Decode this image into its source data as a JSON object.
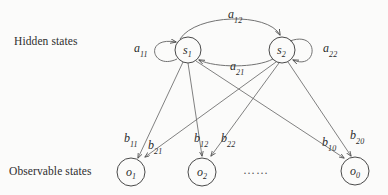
{
  "figure": {
    "type": "hidden-markov-model-diagram",
    "row_labels": {
      "hidden": "Hidden states",
      "observable": "Observable states"
    },
    "ellipsis": "……",
    "stroke_color": "#4a4a4a",
    "text_color": "#2b2b2b",
    "background_color": "#fbfbfa"
  },
  "hidden_states": [
    {
      "id": "s1",
      "base": "s",
      "sub": "1",
      "cx": 188,
      "cy": 50,
      "r": 13
    },
    {
      "id": "s2",
      "base": "s",
      "sub": "2",
      "cx": 282,
      "cy": 50,
      "r": 13
    }
  ],
  "observable_states": [
    {
      "id": "o1",
      "base": "o",
      "sub": "1",
      "cx": 131,
      "cy": 172,
      "r": 14
    },
    {
      "id": "o2",
      "base": "o",
      "sub": "2",
      "cx": 202,
      "cy": 172,
      "r": 14
    },
    {
      "id": "o0",
      "base": "o",
      "sub": "0",
      "cx": 355,
      "cy": 171,
      "r": 14
    }
  ],
  "transition_labels": [
    {
      "id": "a11",
      "base": "a",
      "sub": "11",
      "from": "s1",
      "to": "s1",
      "x": 134,
      "y": 42
    },
    {
      "id": "a12",
      "base": "a",
      "sub": "12",
      "from": "s1",
      "to": "s2",
      "x": 228,
      "y": 8
    },
    {
      "id": "a21",
      "base": "a",
      "sub": "21",
      "from": "s2",
      "to": "s1",
      "x": 230,
      "y": 60
    },
    {
      "id": "a22",
      "base": "a",
      "sub": "22",
      "from": "s2",
      "to": "s2",
      "x": 323,
      "y": 42
    }
  ],
  "emission_labels": [
    {
      "id": "b11",
      "base": "b",
      "sub": "11",
      "from": "s1",
      "to": "o1",
      "x": 124,
      "y": 132
    },
    {
      "id": "b21",
      "base": "b",
      "sub": "21",
      "from": "s2",
      "to": "o1",
      "x": 148,
      "y": 139
    },
    {
      "id": "b12",
      "base": "b",
      "sub": "12",
      "from": "s1",
      "to": "o2",
      "x": 194,
      "y": 132
    },
    {
      "id": "b22",
      "base": "b",
      "sub": "22",
      "from": "s2",
      "to": "o2",
      "x": 221,
      "y": 132
    },
    {
      "id": "b10",
      "base": "b",
      "sub": "10",
      "from": "s1",
      "to": "o0",
      "x": 322,
      "y": 136
    },
    {
      "id": "b20",
      "base": "b",
      "sub": "20",
      "from": "s2",
      "to": "o0",
      "x": 350,
      "y": 129
    }
  ]
}
